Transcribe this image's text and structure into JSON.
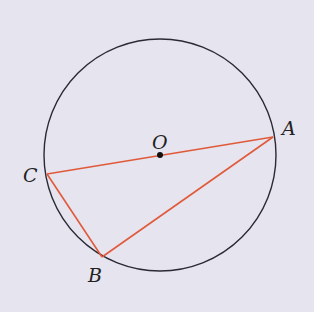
{
  "diagram": {
    "colors": {
      "background": "#e6e4ee",
      "circle": "#2a2a35",
      "segments": "#e05a3a",
      "center_dot": "#111111"
    },
    "points": {
      "O": {
        "label": "O",
        "role": "center"
      },
      "A": {
        "label": "A",
        "role": "on-circle"
      },
      "B": {
        "label": "B",
        "role": "on-circle"
      },
      "C": {
        "label": "C",
        "role": "on-circle"
      }
    },
    "segments": [
      {
        "name": "CA",
        "from": "C",
        "to": "A",
        "note": "diameter through O"
      },
      {
        "name": "CB",
        "from": "C",
        "to": "B"
      },
      {
        "name": "BA",
        "from": "B",
        "to": "A"
      }
    ]
  }
}
